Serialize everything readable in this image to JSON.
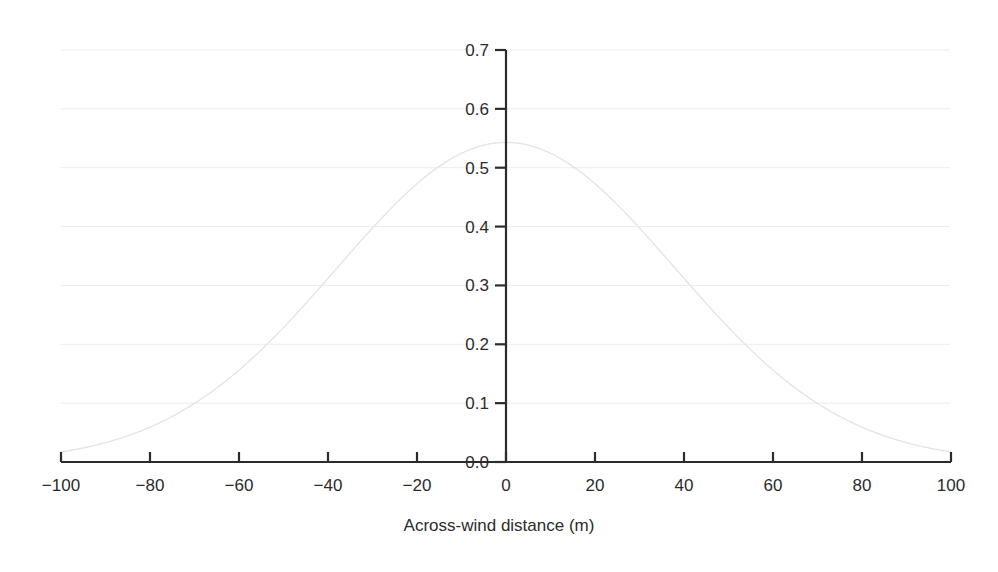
{
  "chart_data": {
    "type": "line",
    "title": "",
    "subtitle": "",
    "xlabel": "Across-wind distance (m)",
    "ylabel": "",
    "xlim": [
      -100,
      100
    ],
    "ylim": [
      0.0,
      0.7
    ],
    "xticks": [
      -100,
      -80,
      -60,
      -40,
      -20,
      0,
      20,
      40,
      60,
      80,
      100
    ],
    "xticklabels": [
      "−100",
      "−80",
      "−60",
      "−40",
      "−20",
      "0",
      "20",
      "40",
      "60",
      "80",
      "100"
    ],
    "yticks": [
      0.0,
      0.1,
      0.2,
      0.3,
      0.4,
      0.5,
      0.6,
      0.7
    ],
    "yticklabels": [
      "0.0",
      "0.1",
      "0.2",
      "0.3",
      "0.4",
      "0.5",
      "0.6",
      "0.7"
    ],
    "grid": "horizontal",
    "legend": "none",
    "annotations": [],
    "series": [
      {
        "name": "across-wind concentration profile",
        "color": "#e3e3e3",
        "linewidth": 1.3,
        "peak_value": 0.543,
        "peak_x": 0,
        "sigma": 38,
        "x": [
          -100,
          -96,
          -92,
          -88,
          -84,
          -80,
          -76,
          -72,
          -68,
          -64,
          -60,
          -56,
          -52,
          -48,
          -44,
          -40,
          -36,
          -32,
          -28,
          -24,
          -20,
          -16,
          -12,
          -8,
          -4,
          0,
          4,
          8,
          12,
          16,
          20,
          24,
          28,
          32,
          36,
          40,
          44,
          48,
          52,
          56,
          60,
          64,
          68,
          72,
          76,
          80,
          84,
          88,
          92,
          96,
          100
        ],
        "values": [
          0.009,
          0.012,
          0.016,
          0.021,
          0.027,
          0.035,
          0.044,
          0.055,
          0.068,
          0.083,
          0.1,
          0.12,
          0.142,
          0.166,
          0.192,
          0.22,
          0.25,
          0.281,
          0.312,
          0.343,
          0.373,
          0.402,
          0.428,
          0.462,
          0.528,
          0.543,
          0.528,
          0.462,
          0.428,
          0.402,
          0.373,
          0.343,
          0.312,
          0.281,
          0.25,
          0.22,
          0.192,
          0.166,
          0.142,
          0.12,
          0.1,
          0.083,
          0.068,
          0.055,
          0.044,
          0.035,
          0.027,
          0.021,
          0.016,
          0.012,
          0.009
        ]
      }
    ],
    "style": {
      "axis_color": "#2b2b2b",
      "grid_color": "#ececec",
      "background": "#ffffff",
      "yaxis_position": "at-x-zero",
      "xtick_direction": "out-up",
      "ytick_direction": "out-left"
    }
  }
}
